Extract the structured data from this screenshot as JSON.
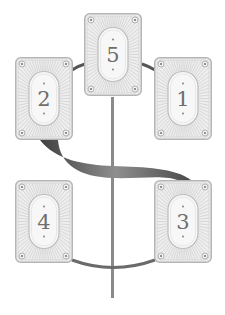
{
  "diagram": {
    "type": "tarot-card-spread",
    "colors": {
      "card_fill": "#eeeeee",
      "card_border": "#b5b5b5",
      "ray": "#c4c4c4",
      "oval_fill": "#f7f7f7",
      "number": "#6e6e6e",
      "connector": "#8a8a8a",
      "ribbon_dark": "#4a4a4a",
      "ribbon_light": "#8c8c8c"
    },
    "cards": [
      {
        "id": "card-5",
        "label": "5",
        "x": 84,
        "y": 13
      },
      {
        "id": "card-2",
        "label": "2",
        "x": 15,
        "y": 57
      },
      {
        "id": "card-1",
        "label": "1",
        "x": 154,
        "y": 57
      },
      {
        "id": "card-4",
        "label": "4",
        "x": 15,
        "y": 180
      },
      {
        "id": "card-3",
        "label": "3",
        "x": 154,
        "y": 180
      }
    ]
  }
}
